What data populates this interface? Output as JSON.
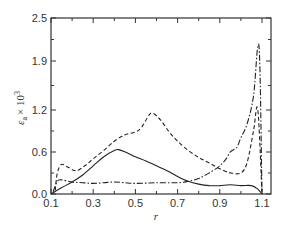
{
  "chart_data": {
    "type": "line",
    "title": "",
    "xlabel": "r",
    "ylabel": "ε_a × 10^3",
    "ylabel_parts": {
      "symbol": "ε",
      "subscript": "a",
      "multiplier": "× 10",
      "exponent": "3"
    },
    "xlim": [
      0.1,
      1.14
    ],
    "ylim": [
      0.0,
      2.5
    ],
    "x_ticks": [
      "0.1",
      "0.3",
      "0.5",
      "0.7",
      "0.9",
      "1.1"
    ],
    "y_ticks": [
      "0.0",
      "0.6",
      "1.2",
      "1.9",
      "2.5"
    ],
    "grid": false,
    "legend": "none",
    "series": [
      {
        "name": "solid",
        "style": "solid",
        "x": [
          0.1,
          0.15,
          0.2,
          0.25,
          0.3,
          0.35,
          0.4,
          0.42,
          0.45,
          0.5,
          0.55,
          0.6,
          0.65,
          0.7,
          0.75,
          0.8,
          0.85,
          0.9,
          0.95,
          1.0,
          1.05,
          1.08,
          1.1
        ],
        "y": [
          0.0,
          0.09,
          0.17,
          0.27,
          0.4,
          0.53,
          0.62,
          0.63,
          0.6,
          0.53,
          0.47,
          0.4,
          0.33,
          0.25,
          0.18,
          0.14,
          0.12,
          0.12,
          0.13,
          0.12,
          0.12,
          0.07,
          0.0
        ]
      },
      {
        "name": "dashed",
        "style": "dashed",
        "x": [
          0.12,
          0.13,
          0.15,
          0.18,
          0.22,
          0.26,
          0.3,
          0.35,
          0.4,
          0.45,
          0.5,
          0.53,
          0.56,
          0.58,
          0.62,
          0.66,
          0.7,
          0.75,
          0.8,
          0.85,
          0.9,
          0.95,
          1.0,
          1.03,
          1.06,
          1.08,
          1.1
        ],
        "y": [
          0.05,
          0.3,
          0.42,
          0.38,
          0.33,
          0.4,
          0.5,
          0.62,
          0.75,
          0.84,
          0.88,
          0.95,
          1.1,
          1.15,
          1.05,
          0.88,
          0.75,
          0.62,
          0.52,
          0.44,
          0.36,
          0.3,
          0.3,
          0.45,
          0.9,
          1.2,
          0.0
        ]
      },
      {
        "name": "dash-dot",
        "style": "dashdot",
        "x": [
          0.11,
          0.13,
          0.15,
          0.2,
          0.25,
          0.3,
          0.35,
          0.4,
          0.45,
          0.5,
          0.6,
          0.7,
          0.75,
          0.8,
          0.85,
          0.9,
          0.93,
          0.95,
          0.98,
          1.0,
          1.03,
          1.06,
          1.08,
          1.09,
          1.1
        ],
        "y": [
          0.03,
          0.18,
          0.2,
          0.17,
          0.16,
          0.15,
          0.16,
          0.17,
          0.16,
          0.15,
          0.16,
          0.16,
          0.18,
          0.22,
          0.3,
          0.4,
          0.5,
          0.6,
          0.66,
          0.8,
          1.0,
          1.4,
          2.1,
          1.8,
          0.0
        ]
      }
    ]
  }
}
